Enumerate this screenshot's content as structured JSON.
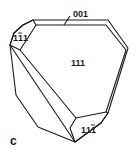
{
  "diagram": {
    "type": "crystal-morphology",
    "panel_label": "c",
    "faces": [
      {
        "id": "face-111",
        "label": "111",
        "position": "center"
      },
      {
        "id": "face-1-11",
        "label": "1̅1̅1",
        "display": "1 1̄ 1",
        "position": "upper-left"
      },
      {
        "id": "face-11-1",
        "label": "11̅1",
        "display": "1 1 1̄",
        "position": "bottom"
      },
      {
        "id": "face-001",
        "label": "001",
        "position": "top-edge",
        "leader_line": true
      }
    ],
    "labels": {
      "main": "111",
      "upper_left_digits": [
        "1",
        "1",
        "1"
      ],
      "upper_left_bar_index": 1,
      "bottom_digits": [
        "1",
        "1",
        "1"
      ],
      "bottom_bar_index": 2,
      "top": "001",
      "panel": "c"
    },
    "colors": {
      "stroke": "#1a1a1a",
      "background": "#ffffff"
    }
  }
}
